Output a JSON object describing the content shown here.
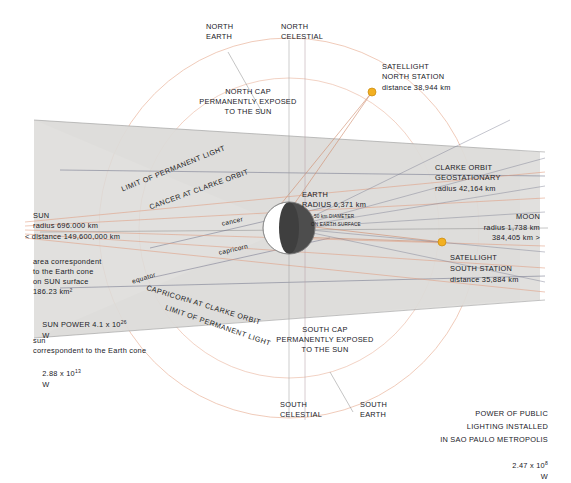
{
  "diagram": {
    "colors": {
      "cone_fill": "#dcdcda",
      "orbit_line": "#e8a98f",
      "ray_line": "#6d6f86",
      "satellite": "#f0a81e",
      "earth_shadow": "#4a4a4a",
      "text": "#20201f"
    }
  },
  "labels": {
    "north_earth": "NORTH\nEARTH",
    "north_celestial": "NORTH\nCELESTIAL",
    "south_earth": "SOUTH\nEARTH",
    "south_celestial": "SOUTH\nCELESTIAL",
    "north_cap": "NORTH CAP\nPERMANENTLY EXPOSED\nTO THE SUN",
    "south_cap": "SOUTH CAP\nPERMANENTLY EXPOSED\nTO THE SUN",
    "limit_north": "LIMIT OF PERMANENT LIGHT",
    "limit_south": "LIMIT OF PERMANENT LIGHT",
    "cancer_clarke": "CANCER AT CLARKE ORBIT",
    "capricorn_clarke": "CAPRICORN AT CLARKE ORBIT",
    "cancer": "cancer",
    "capricorn": "capricorn",
    "equator": "equator"
  },
  "satellite_north": {
    "name": "SATELLIGHT",
    "station": "NORTH STATION",
    "distance": "distance 38,944 km"
  },
  "satellite_south": {
    "name": "SATELLIGHT",
    "station": "SOUTH STATION",
    "distance": "distance 35,884 km"
  },
  "clarke": {
    "line1": "CLARKE ORBIT",
    "line2": "GEOSTATIONARY",
    "line3": "radius 42,164 km"
  },
  "earth": {
    "name": "EARTH",
    "radius": "RADIUS 6,371 km",
    "spot_line1": "50 km DIAMETER",
    "spot_line2": "ON EARTH SURFACE"
  },
  "sun": {
    "name": "SUN",
    "radius": "radius 696.000 km",
    "distance": "< distance 149,600,000 km",
    "area_line1": "area correspondent",
    "area_line2": "to the Earth cone",
    "area_line3": "on SUN surface",
    "area_line4": "186.23 km²",
    "power_prefix": "SUN POWER 4.1 x 10",
    "power_exp": "26",
    "power_unit": "W",
    "corr_line1": "sun",
    "corr_line2": "correspondent to the Earth cone",
    "corr_prefix": "2.88 x 10",
    "corr_exp": "13",
    "corr_unit": "W"
  },
  "moon": {
    "name": "MOON",
    "radius": "radius 1,738 km",
    "distance": "384,405 km >"
  },
  "footer": {
    "line1": "POWER OF PUBLIC",
    "line2": "LIGHTING INSTALLED",
    "line3": "IN SAO PAULO METROPOLIS",
    "value_prefix": "2.47 x 10",
    "value_exp": "8",
    "value_unit": "W"
  }
}
